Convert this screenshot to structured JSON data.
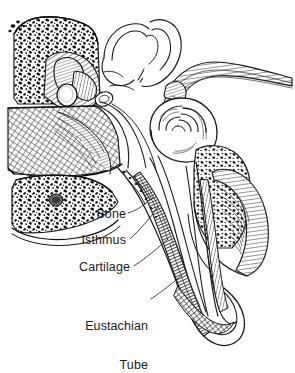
{
  "figure": {
    "type": "medical-line-illustration",
    "background_color": "#ffffff",
    "ink_color": "#1a1a1a",
    "width": 295,
    "height": 358
  },
  "labels": [
    {
      "id": "bone",
      "text": "Bone",
      "x": 86,
      "y": 208,
      "leader_from": [
        128,
        214
      ],
      "leader_to": [
        152,
        198
      ]
    },
    {
      "id": "isthmus",
      "text": "Isthmus",
      "x": 77,
      "y": 234,
      "leader_from": [
        130,
        240
      ],
      "leader_to": [
        158,
        208
      ]
    },
    {
      "id": "cartilage",
      "text": "Cartilage",
      "x": 82,
      "y": 261,
      "leader_from": [
        134,
        267
      ],
      "leader_to": [
        168,
        240
      ]
    },
    {
      "id": "eustachian_tube",
      "line1": "Eustachian",
      "line2": "Tube",
      "text": "Eustachian Tube",
      "x": 87,
      "y": 294,
      "leader_from": [
        150,
        300
      ],
      "leader_to": [
        182,
        276
      ]
    }
  ],
  "structures": [
    {
      "name": "mastoid-air-cells",
      "texture": "stippled-cancellous-bone"
    },
    {
      "name": "ossicles",
      "texture": "hatched"
    },
    {
      "name": "semicircular-canals",
      "texture": "outline"
    },
    {
      "name": "cochlea",
      "texture": "spiral-hatched"
    },
    {
      "name": "tensor-veli-palatini-muscle",
      "texture": "fine-hatched"
    },
    {
      "name": "levator-veli-palatini-muscle",
      "texture": "cross-hatched"
    },
    {
      "name": "pterygoid-plate",
      "texture": "stippled-cancellous-bone"
    },
    {
      "name": "eustachian-tube-lumen",
      "texture": "dense-hatched"
    },
    {
      "name": "cartilage-portion",
      "texture": "hatched"
    },
    {
      "name": "bony-portion",
      "texture": "stippled"
    },
    {
      "name": "isthmus-narrowing",
      "texture": "outline"
    }
  ]
}
